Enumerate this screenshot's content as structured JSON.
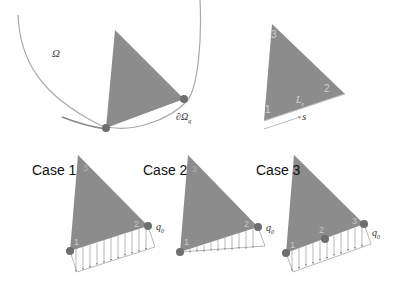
{
  "figure": {
    "colors": {
      "triangle_fill": "#8c8c8c",
      "node_fill": "#6e6e6e",
      "boundary_curve": "#999999",
      "load_arrow": "#9a9a9a",
      "node_label": "#d0d0d0"
    },
    "domain_panel": {
      "domain_label": "Ω",
      "boundary_label": "∂Ω",
      "boundary_subscript": "q"
    },
    "element_panel": {
      "node_labels": [
        "1",
        "2",
        "3"
      ],
      "edge_length_label": "L",
      "edge_length_subscript": "e",
      "coordinate_label": "s"
    },
    "cases": [
      {
        "label": "Case 1",
        "node_labels": [
          "1",
          "2",
          "3"
        ],
        "load_label": "q",
        "load_subscript": "0",
        "load_type": "uniform"
      },
      {
        "label": "Case 2",
        "node_labels": [
          "1",
          "2",
          "3"
        ],
        "load_label": "q",
        "load_subscript": "0",
        "load_type": "linear"
      },
      {
        "label": "Case 3",
        "node_labels": [
          "1",
          "2",
          "3"
        ],
        "load_label": "q",
        "load_subscript": "0",
        "load_type": "uniform-quadratic"
      }
    ]
  }
}
